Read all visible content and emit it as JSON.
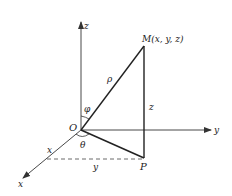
{
  "diagram": {
    "type": "spherical-coordinates",
    "colors": {
      "stroke": "#222222",
      "axis": "#333333",
      "background": "#ffffff"
    },
    "axes": {
      "x_label": "x",
      "y_label": "y",
      "z_label": "z"
    },
    "points": {
      "origin_label": "O",
      "M_label": "M(x, y, z)",
      "P_label": "P"
    },
    "segment_labels": {
      "rho": "ρ",
      "z_height": "z",
      "x_proj": "x",
      "y_proj": "y"
    },
    "angle_labels": {
      "phi": "φ",
      "theta": "θ"
    }
  }
}
